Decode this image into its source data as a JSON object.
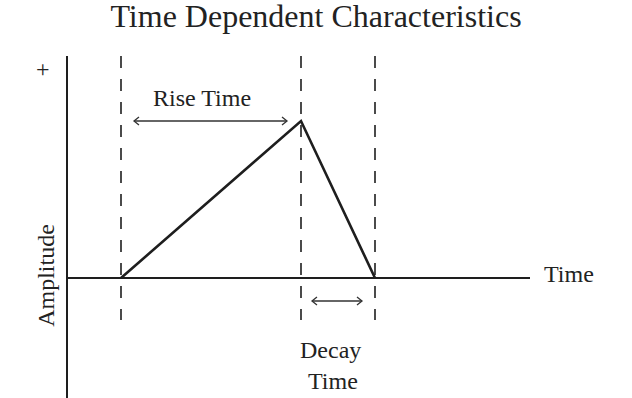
{
  "title": "Time Dependent Characteristics",
  "axes": {
    "y_label": "Amplitude",
    "y_positive_marker": "+",
    "x_label": "Time"
  },
  "annotations": {
    "rise_time": "Rise Time",
    "decay_time_line1": "Decay",
    "decay_time_line2": "Time"
  },
  "shape": {
    "type": "triangular pulse",
    "points": [
      {
        "name": "start",
        "x": 121,
        "y": 278
      },
      {
        "name": "peak",
        "x": 301,
        "y": 121
      },
      {
        "name": "end",
        "x": 375,
        "y": 278
      }
    ]
  },
  "colors": {
    "line": "#1e1e1e",
    "background": "#ffffff"
  }
}
